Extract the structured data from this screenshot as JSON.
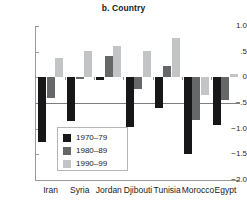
{
  "chart_data": {
    "type": "bar",
    "title": "b. Country",
    "xlabel": "",
    "ylabel": "",
    "ylim": [
      -2.0,
      1.0
    ],
    "grid": false,
    "legend_position": "inside-lower-left",
    "categories": [
      "Iran",
      "Syria",
      "Jordan",
      "Djibouti",
      "Tunisia",
      "Morocco",
      "Egypt"
    ],
    "ytick_labels": [
      "1.0",
      ".5",
      "0",
      "−.5",
      "−1.0",
      "−1.5",
      "−2.0"
    ],
    "ytick_values": [
      1.0,
      0.5,
      0.0,
      -0.5,
      -1.0,
      -1.5,
      -2.0
    ],
    "series": [
      {
        "name": "1970–79",
        "color": "#17171a",
        "values": [
          -1.26,
          -0.86,
          -0.06,
          -0.97,
          -0.59,
          -1.5,
          -0.93
        ]
      },
      {
        "name": "1980–89",
        "color": "#666769",
        "values": [
          -0.41,
          -0.04,
          0.41,
          -0.23,
          0.23,
          -0.84,
          -0.44
        ]
      },
      {
        "name": "1990–99",
        "color": "#c3c4c5",
        "values": [
          0.38,
          0.51,
          0.62,
          0.52,
          0.76,
          -0.34,
          0.07
        ]
      }
    ]
  }
}
